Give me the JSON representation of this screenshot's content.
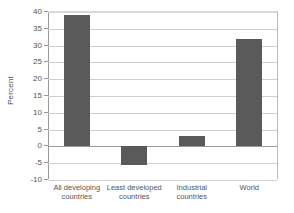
{
  "chart_data": {
    "type": "bar",
    "title": "",
    "subtitle": "",
    "xlabel": "",
    "ylabel": "Percent",
    "ylim": [
      -10,
      40
    ],
    "yticks": [
      40,
      35,
      30,
      25,
      20,
      15,
      10,
      5,
      0,
      -5,
      -10
    ],
    "ytick_labels": [
      "40",
      "35",
      "30",
      "25",
      "20",
      "15",
      "10",
      "5",
      "0",
      "-5",
      "-10"
    ],
    "grid": true,
    "legend": false,
    "legend_position": "none",
    "bar_color": "#5a5a5a",
    "grid_color": "#cfcfcf",
    "axis_color": "#9a9a9a",
    "categories": [
      "All developing countries",
      "Least developed countries",
      "Industrial countries",
      "World"
    ],
    "category_lines": [
      [
        "All developing",
        "countries"
      ],
      [
        "Least developed",
        "countries"
      ],
      [
        "Industrial",
        "countries"
      ],
      [
        "World",
        ""
      ]
    ],
    "values": [
      39,
      -5.5,
      3.2,
      32
    ]
  },
  "axis": {
    "y_title": "Percent"
  }
}
